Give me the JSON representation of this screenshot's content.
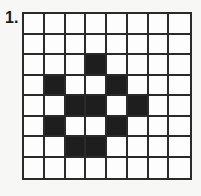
{
  "puzzle": {
    "number_label": "1.",
    "rows": 8,
    "cols": 8,
    "filled_color": "#1e1e1e",
    "empty_color": "#fdfdfd",
    "filled_cells": [
      [
        2,
        3
      ],
      [
        3,
        1
      ],
      [
        3,
        4
      ],
      [
        4,
        2
      ],
      [
        4,
        3
      ],
      [
        4,
        5
      ],
      [
        5,
        1
      ],
      [
        5,
        4
      ],
      [
        6,
        2
      ],
      [
        6,
        3
      ]
    ]
  }
}
